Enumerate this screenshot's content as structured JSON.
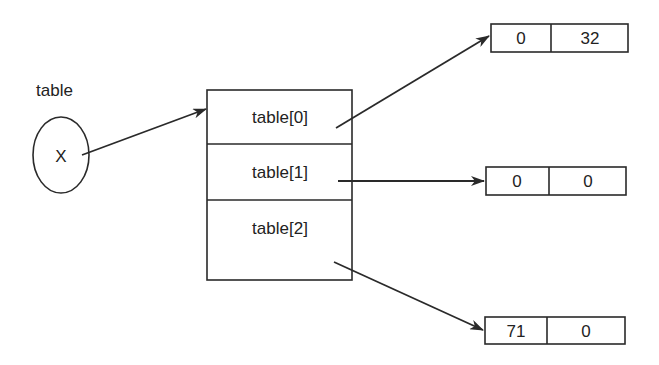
{
  "diagram": {
    "variable": {
      "label": "table",
      "value": "X"
    },
    "array": {
      "slots": [
        {
          "label": "table[0]"
        },
        {
          "label": "table[1]"
        },
        {
          "label": "table[2]"
        }
      ]
    },
    "row_arrays": [
      {
        "cells": [
          "0",
          "32"
        ]
      },
      {
        "cells": [
          "0",
          "0"
        ]
      },
      {
        "cells": [
          "71",
          "0"
        ]
      }
    ],
    "colors": {
      "stroke": "#2a2a2a",
      "background": "#ffffff",
      "text": "#222222"
    }
  }
}
